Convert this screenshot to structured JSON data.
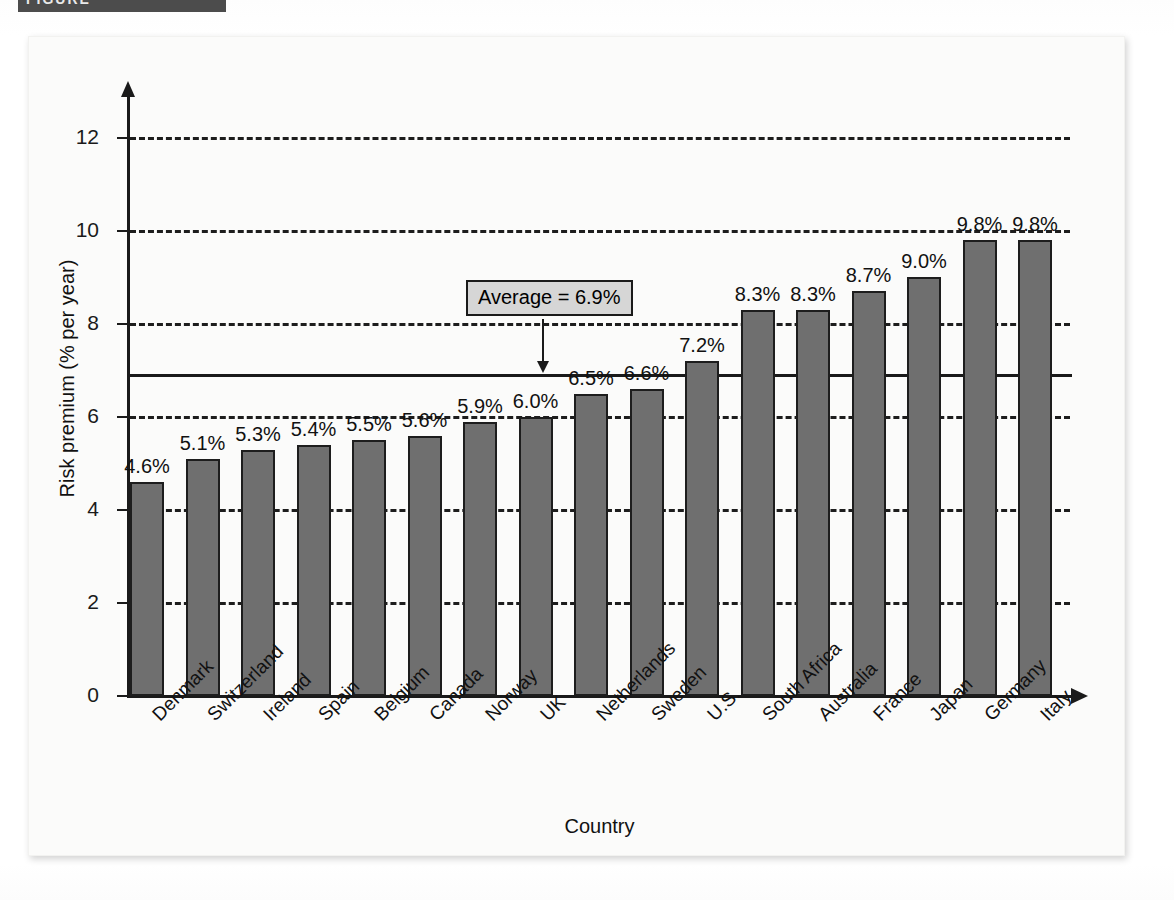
{
  "figure_banner": {
    "label": "FIGURE"
  },
  "chart_data": {
    "type": "bar",
    "title": "",
    "xlabel": "Country",
    "ylabel": "Risk premium (% per year)",
    "ylim": [
      0,
      12.6
    ],
    "yticks": [
      0,
      2,
      4,
      6,
      8,
      10,
      12
    ],
    "ytick_labels": [
      "0",
      "2",
      "4",
      "6",
      "8",
      "10",
      "12"
    ],
    "grid": "horizontal-dashed",
    "legend": "none",
    "categories": [
      "Denmark",
      "Switzerland",
      "Ireland",
      "Spain",
      "Belgium",
      "Canada",
      "Norway",
      "UK",
      "Netherlands",
      "Sweden",
      "U.S.",
      "South Africa",
      "Australia",
      "France",
      "Japan",
      "Germany",
      "Italy"
    ],
    "values": [
      4.6,
      5.1,
      5.3,
      5.4,
      5.5,
      5.6,
      5.9,
      6.0,
      6.5,
      6.6,
      7.2,
      8.3,
      8.3,
      8.7,
      9.0,
      9.8,
      9.8
    ],
    "value_labels": [
      "4.6%",
      "5.1%",
      "5.3%",
      "5.4%",
      "5.5%",
      "5.6%",
      "5.9%",
      "6.0%",
      "6.5%",
      "6.6%",
      "7.2%",
      "8.3%",
      "8.3%",
      "8.7%",
      "9.0%",
      "9.8%",
      "9.8%"
    ],
    "annotations": [
      {
        "name": "average-callout",
        "text": "Average = 6.9%",
        "value": 6.9,
        "style": "boxed-label-with-down-arrow"
      }
    ],
    "average_line": {
      "label": "Average = 6.9%",
      "value": 6.9
    },
    "colors": {
      "bar_fill": "#6f6f6f",
      "bar_stroke": "#1d1d1d",
      "axis": "#1a1a1a",
      "gridline": "#1d1d1d",
      "callout_fill": "#d6d6d6",
      "card_background": "#fbfbfa",
      "banner": "#4c4c4c"
    }
  }
}
